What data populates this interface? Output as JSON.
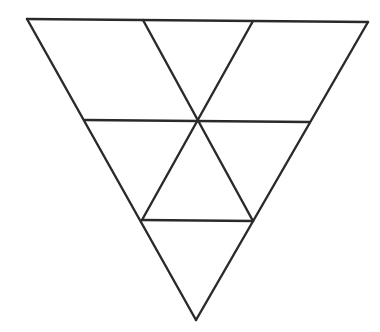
{
  "figure": {
    "background": "#ffffff",
    "stroke_color": "#2a2a2a",
    "width": 380,
    "height": 332
  },
  "vertices": {
    "top_left": [
      27,
      19
    ],
    "top_div_1": [
      143,
      20
    ],
    "top_div_2": [
      253,
      21
    ],
    "top_right": [
      368,
      22
    ],
    "mid_left": [
      85,
      120
    ],
    "center": [
      198,
      121
    ],
    "mid_right": [
      309,
      122
    ],
    "low_left": [
      142,
      220
    ],
    "low_right": [
      253,
      221
    ],
    "bottom": [
      196,
      320
    ]
  },
  "segments": [
    {
      "name": "outer-top-edge",
      "from": "top_left",
      "to": "top_right"
    },
    {
      "name": "outer-right-edge",
      "from": "top_right",
      "to": "bottom"
    },
    {
      "name": "outer-left-edge",
      "from": "bottom",
      "to": "top_left"
    },
    {
      "name": "middle-horizontal-line",
      "from": "mid_left",
      "to": "mid_right"
    },
    {
      "name": "lower-horizontal-line",
      "from": "low_left",
      "to": "low_right"
    },
    {
      "name": "diagonal-down-right",
      "from": "top_div_1",
      "to": "low_right"
    },
    {
      "name": "diagonal-down-left",
      "from": "top_div_2",
      "to": "low_left"
    }
  ]
}
